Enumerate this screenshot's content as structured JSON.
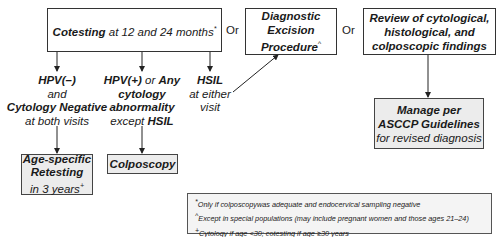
{
  "cotesting": {
    "bold": "Cotesting",
    "rest": " at 12 and 24 months",
    "mark": "*"
  },
  "or_labels": [
    "Or",
    "Or"
  ],
  "diagnostic": {
    "lines": [
      "Diagnostic",
      "Excision",
      "Procedure"
    ],
    "mark": "^"
  },
  "review": {
    "lines": [
      "Review  of cytological,",
      "histological, and",
      "colposcopic findings"
    ]
  },
  "branch_neg": {
    "l1": "HPV(–)",
    "l2": "and",
    "l3": "Cytology Negative",
    "l4": "at both visits"
  },
  "branch_pos": {
    "l1a": "HPV(+)",
    "l1b": " or ",
    "l1c": "Any",
    "l2": "cytology",
    "l3": "abnormality",
    "l4a": "except ",
    "l4b": "HSIL"
  },
  "branch_hsil": {
    "l1": "HSIL",
    "l2": "at either",
    "l3": "visit"
  },
  "retesting": {
    "l1": "Age-specific",
    "l2": "Retesting",
    "l3": "in 3 years",
    "mark": "+"
  },
  "colposcopy": {
    "label": "Colposcopy"
  },
  "manage": {
    "l1": "Manage per",
    "l2": "ASCCP Guidelines",
    "l3": "for revised diagnosis"
  },
  "footnotes": [
    {
      "mark": "*",
      "text": "Only if colposcopywas adequate and endocervical sampling negative"
    },
    {
      "mark": "^",
      "text": "Except in special populations (may include pregnant women and those ages 21–24)"
    },
    {
      "mark": "+",
      "text": "Cytology if age <30; cotesting if age ≥30 years"
    }
  ]
}
